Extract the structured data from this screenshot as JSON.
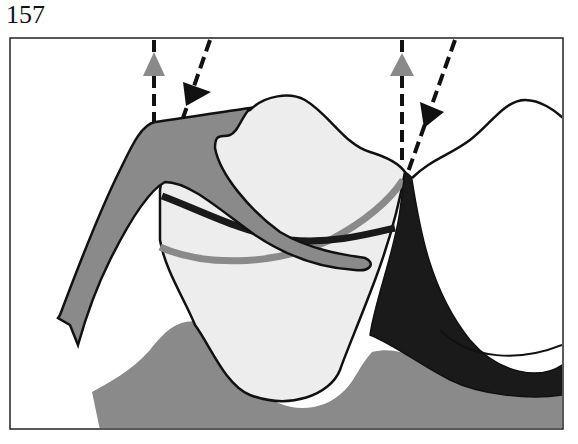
{
  "figure": {
    "number": "157",
    "type": "dental cross-section illustration",
    "elements": [
      "gray-upward-arrow-left",
      "black-downward-arrow-left",
      "gray-upward-arrow-right",
      "black-downward-arrow-right",
      "tooth-crown",
      "adjacent-tooth",
      "gray-flap",
      "black-interproximal-wedge",
      "gray-gingiva",
      "gray-band",
      "black-band"
    ]
  },
  "colors": {
    "frame": "#222222",
    "tooth_fill": "#ededed",
    "gray": "#8a8a8a",
    "black": "#1a1a1a",
    "background": "#ffffff"
  }
}
